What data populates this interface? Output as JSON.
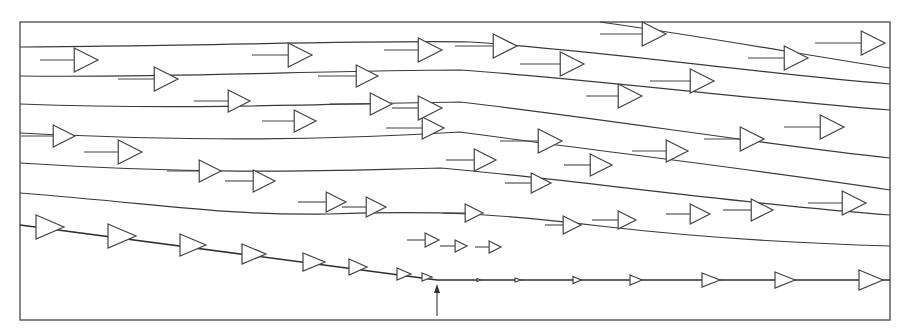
{
  "diagram": {
    "type": "streamline-velocity-field",
    "colors": {
      "line": "#3a3a3a",
      "frame": "#555555",
      "background": "#ffffff"
    },
    "frame": {
      "x": 20,
      "y": 22,
      "width": 870,
      "height": 298
    },
    "streamlines": [
      "M20,47 C200,46 380,40 470,42 C600,50 760,74 890,84",
      "M20,76 C180,78 330,70 460,70 C600,80 760,100 890,110",
      "M20,104 C190,110 320,104 460,102 C600,118 760,144 890,158",
      "M20,133 C200,142 330,140 460,132 C590,150 760,170 890,190",
      "M20,163 C220,176 340,170 440,168 C560,178 740,204 890,215",
      "M20,193 C170,205 230,216 330,214 C440,210 500,214 600,226 C720,240 820,244 890,246",
      "M600,22 C700,36 800,54 890,68"
    ],
    "wall": {
      "sloped": {
        "x1": 20,
        "y1": 225,
        "x2": 437,
        "y2": 280
      },
      "flat": {
        "x1": 437,
        "y1": 280,
        "x2": 890,
        "y2": 280
      }
    },
    "marker_arrow": {
      "x": 437,
      "y_from": 316,
      "y_to": 284,
      "meaning": "separation point"
    },
    "vectors": [
      {
        "x": 40,
        "y": 60,
        "len": 58,
        "h": 12
      },
      {
        "x": 118,
        "y": 79,
        "len": 60,
        "h": 12
      },
      {
        "x": 194,
        "y": 101,
        "len": 56,
        "h": 11
      },
      {
        "x": 252,
        "y": 55,
        "len": 60,
        "h": 12
      },
      {
        "x": 318,
        "y": 76,
        "len": 60,
        "h": 11
      },
      {
        "x": 384,
        "y": 50,
        "len": 58,
        "h": 12
      },
      {
        "x": 455,
        "y": 46,
        "len": 62,
        "h": 12
      },
      {
        "x": 520,
        "y": 64,
        "len": 64,
        "h": 12
      },
      {
        "x": 600,
        "y": 34,
        "len": 66,
        "h": 12
      },
      {
        "x": 748,
        "y": 58,
        "len": 60,
        "h": 12
      },
      {
        "x": 815,
        "y": 43,
        "len": 70,
        "h": 12
      },
      {
        "x": 262,
        "y": 121,
        "len": 54,
        "h": 11
      },
      {
        "x": 330,
        "y": 104,
        "len": 62,
        "h": 11
      },
      {
        "x": 386,
        "y": 128,
        "len": 58,
        "h": 11
      },
      {
        "x": 392,
        "y": 108,
        "len": 50,
        "h": 12
      },
      {
        "x": 586,
        "y": 96,
        "len": 56,
        "h": 12
      },
      {
        "x": 650,
        "y": 81,
        "len": 64,
        "h": 12
      },
      {
        "x": 21,
        "y": 136,
        "len": 54,
        "h": 11
      },
      {
        "x": 84,
        "y": 152,
        "len": 58,
        "h": 12
      },
      {
        "x": 167,
        "y": 171,
        "len": 54,
        "h": 11
      },
      {
        "x": 225,
        "y": 181,
        "len": 50,
        "h": 11
      },
      {
        "x": 446,
        "y": 160,
        "len": 50,
        "h": 11
      },
      {
        "x": 500,
        "y": 141,
        "len": 62,
        "h": 12
      },
      {
        "x": 564,
        "y": 165,
        "len": 48,
        "h": 11
      },
      {
        "x": 632,
        "y": 151,
        "len": 56,
        "h": 11
      },
      {
        "x": 704,
        "y": 139,
        "len": 60,
        "h": 12
      },
      {
        "x": 784,
        "y": 127,
        "len": 60,
        "h": 12
      },
      {
        "x": 298,
        "y": 202,
        "len": 48,
        "h": 10
      },
      {
        "x": 342,
        "y": 207,
        "len": 44,
        "h": 10
      },
      {
        "x": 443,
        "y": 213,
        "len": 40,
        "h": 9
      },
      {
        "x": 505,
        "y": 183,
        "len": 46,
        "h": 10
      },
      {
        "x": 545,
        "y": 225,
        "len": 36,
        "h": 9
      },
      {
        "x": 592,
        "y": 220,
        "len": 44,
        "h": 9
      },
      {
        "x": 666,
        "y": 214,
        "len": 44,
        "h": 10
      },
      {
        "x": 723,
        "y": 210,
        "len": 50,
        "h": 11
      },
      {
        "x": 808,
        "y": 203,
        "len": 58,
        "h": 12
      },
      {
        "x": 407,
        "y": 240,
        "len": 32,
        "h": 7
      },
      {
        "x": 440,
        "y": 246,
        "len": 27,
        "h": 6
      },
      {
        "x": 475,
        "y": 247,
        "len": 26,
        "h": 6
      }
    ],
    "wall_vectors": [
      {
        "x": 36,
        "y": 227,
        "h": 12,
        "len": 14
      },
      {
        "x": 108,
        "y": 236,
        "h": 12,
        "len": 14
      },
      {
        "x": 180,
        "y": 245,
        "h": 11,
        "len": 13
      },
      {
        "x": 242,
        "y": 254,
        "h": 10,
        "len": 12
      },
      {
        "x": 303,
        "y": 262,
        "h": 9,
        "len": 11
      },
      {
        "x": 349,
        "y": 267,
        "h": 8,
        "len": 9
      },
      {
        "x": 397,
        "y": 274,
        "h": 6,
        "len": 7
      },
      {
        "x": 422,
        "y": 277,
        "h": 4,
        "len": 5
      },
      {
        "x": 477,
        "y": 280,
        "h": 1.5,
        "len": 2
      },
      {
        "x": 515,
        "y": 280,
        "h": 2,
        "len": 3
      },
      {
        "x": 573,
        "y": 280,
        "h": 3.5,
        "len": 4
      },
      {
        "x": 630,
        "y": 280,
        "h": 5,
        "len": 6
      },
      {
        "x": 702,
        "y": 280,
        "h": 7,
        "len": 9
      },
      {
        "x": 775,
        "y": 280,
        "h": 8,
        "len": 10
      },
      {
        "x": 859,
        "y": 280,
        "h": 10,
        "len": 12
      }
    ]
  }
}
